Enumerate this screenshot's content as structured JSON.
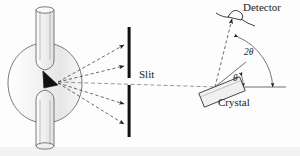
{
  "figure": {
    "background_color": "#fdfdfd",
    "ink_color": "#1c1c1c",
    "labels": {
      "detector": "Detector",
      "crystal": "Crystal",
      "slit": "Slit",
      "two_theta": "2θ",
      "theta": "θ"
    },
    "components": {
      "xray_tube": {
        "name": "x-ray-tube",
        "description": "glass bulb with upper and lower cylindrical necks and an angled dark target",
        "bulb_center_x": 45,
        "bulb_center_y": 83,
        "bulb_radius_x": 38,
        "bulb_radius_y": 40,
        "target_color": "#101010"
      },
      "slit": {
        "name": "slit-assembly",
        "bar_x": 129,
        "upper_bar_top": 27,
        "upper_bar_bottom": 78,
        "lower_bar_top": 85,
        "lower_bar_bottom": 137,
        "bar_color": "#111111",
        "bar_width": 3
      },
      "beams": {
        "name": "x-ray-beams",
        "origin_x": 58,
        "origin_y": 82,
        "style": "dashed",
        "arrow_endpoints": [
          {
            "x": 127,
            "y": 44
          },
          {
            "x": 127,
            "y": 66
          },
          {
            "x": 127,
            "y": 104
          },
          {
            "x": 127,
            "y": 124
          }
        ],
        "axis_line": {
          "x1": 58,
          "y1": 82,
          "x2": 215,
          "y2": 87
        }
      },
      "crystal": {
        "name": "crystal-sample",
        "center_x": 222,
        "center_y": 92,
        "width": 44,
        "height": 15,
        "rotation_deg": -22,
        "fill": "#f0f0f0"
      },
      "detector": {
        "name": "detector-head",
        "x": 238,
        "y": 11,
        "arrow_tip_x": 233,
        "arrow_tip_y": 17
      },
      "angle_arcs": {
        "name": "angle-arcs",
        "vertex_x": 215,
        "vertex_y": 87,
        "theta_radius": 28,
        "two_theta_radius": 58,
        "baseline_x2": 285
      }
    }
  }
}
